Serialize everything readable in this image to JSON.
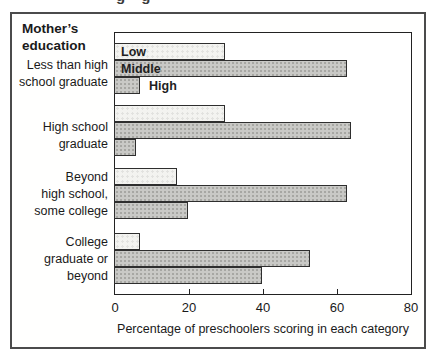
{
  "page": {
    "cropped_text_fragment": "g g"
  },
  "figure": {
    "group_axis_title": "Mother’s\neducation",
    "xaxis_title": "Percentage of preschoolers scoring in each category"
  },
  "chart_data": {
    "type": "bar",
    "orientation": "horizontal",
    "title": "",
    "group_axis_label": "Mother’s education",
    "xlabel": "Percentage of preschoolers scoring in each category",
    "xlim": [
      0,
      80
    ],
    "x_ticks": [
      0,
      20,
      40,
      60,
      80
    ],
    "inner_tick_values": [
      20,
      40,
      60
    ],
    "grid": false,
    "legend": {
      "position": "inline-first-group",
      "entries": [
        "Low",
        "Middle",
        "High"
      ]
    },
    "categories": [
      "Less than high school graduate",
      "High school graduate",
      "Beyond high school, some college",
      "College graduate or beyond"
    ],
    "category_label_lines": [
      [
        "Less than high",
        "school graduate"
      ],
      [
        "High school",
        "graduate"
      ],
      [
        "Beyond",
        "high school,",
        "some college"
      ],
      [
        "College",
        "graduate or",
        "beyond"
      ]
    ],
    "series": [
      {
        "name": "Low",
        "values": [
          30,
          30,
          17,
          7
        ],
        "style": "low"
      },
      {
        "name": "Middle",
        "values": [
          63,
          64,
          63,
          53
        ],
        "style": "mid"
      },
      {
        "name": "High",
        "values": [
          7,
          6,
          20,
          40
        ],
        "style": "mid"
      }
    ]
  },
  "colors": {
    "low_bar_fill": "#f3f3f0",
    "gray_bar_fill": "#c9c9c6",
    "bar_border": "#2e2e2e",
    "plot_border": "#222222",
    "figure_border": "#4b4b4b",
    "text": "#1a1a1a"
  }
}
